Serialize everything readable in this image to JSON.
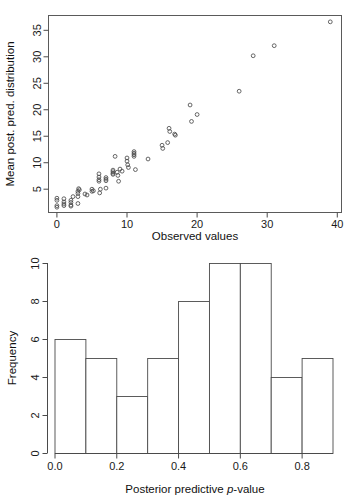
{
  "figure": {
    "panels": [
      "scatter",
      "histogram"
    ]
  },
  "chart_data": [
    {
      "type": "scatter",
      "title": "",
      "xlabel": "Observed values",
      "ylabel": "Mean post. pred. distribution",
      "xlim": [
        -1.2,
        40.6
      ],
      "ylim": [
        0.6,
        37.8
      ],
      "xticks": [
        0,
        10,
        20,
        30,
        40
      ],
      "xticklabels": [
        "0",
        "10",
        "20",
        "30",
        "40"
      ],
      "yticks": [
        5,
        10,
        15,
        20,
        25,
        30,
        35
      ],
      "yticklabels": [
        "5",
        "10",
        "15",
        "20",
        "25",
        "30",
        "35"
      ],
      "grid": false,
      "legend": null,
      "marker": "open-circle",
      "points": [
        [
          0.0,
          3.3
        ],
        [
          0.0,
          2.9
        ],
        [
          0.0,
          1.9
        ],
        [
          0.0,
          1.6
        ],
        [
          1.0,
          3.2
        ],
        [
          1.0,
          2.6
        ],
        [
          1.0,
          2.2
        ],
        [
          1.0,
          1.9
        ],
        [
          2.0,
          2.9
        ],
        [
          2.0,
          2.5
        ],
        [
          2.0,
          2.0
        ],
        [
          2.0,
          1.8
        ],
        [
          2.3,
          3.6
        ],
        [
          3.0,
          4.6
        ],
        [
          3.0,
          4.2
        ],
        [
          3.0,
          3.6
        ],
        [
          3.1,
          5.1
        ],
        [
          3.2,
          4.9
        ],
        [
          3.0,
          2.3
        ],
        [
          4.0,
          4.1
        ],
        [
          4.3,
          3.9
        ],
        [
          5.0,
          5.0
        ],
        [
          5.2,
          4.7
        ],
        [
          5.0,
          4.6
        ],
        [
          6.0,
          7.9
        ],
        [
          6.0,
          7.3
        ],
        [
          6.0,
          6.8
        ],
        [
          6.0,
          6.5
        ],
        [
          6.1,
          4.3
        ],
        [
          6.2,
          5.0
        ],
        [
          7.0,
          7.2
        ],
        [
          7.0,
          6.9
        ],
        [
          7.0,
          6.6
        ],
        [
          7.0,
          5.2
        ],
        [
          8.0,
          8.6
        ],
        [
          8.0,
          8.3
        ],
        [
          8.0,
          8.0
        ],
        [
          8.0,
          7.8
        ],
        [
          8.3,
          11.2
        ],
        [
          8.6,
          8.2
        ],
        [
          8.7,
          7.6
        ],
        [
          8.8,
          6.5
        ],
        [
          9.0,
          8.8
        ],
        [
          9.3,
          8.4
        ],
        [
          10.0,
          10.9
        ],
        [
          10.0,
          10.3
        ],
        [
          10.1,
          9.6
        ],
        [
          10.2,
          9.1
        ],
        [
          11.0,
          12.1
        ],
        [
          11.0,
          11.8
        ],
        [
          11.0,
          11.5
        ],
        [
          11.0,
          11.2
        ],
        [
          11.2,
          8.7
        ],
        [
          13.0,
          10.7
        ],
        [
          15.0,
          13.3
        ],
        [
          15.1,
          12.7
        ],
        [
          15.8,
          13.8
        ],
        [
          16.0,
          16.5
        ],
        [
          16.1,
          15.9
        ],
        [
          16.8,
          15.4
        ],
        [
          16.9,
          15.2
        ],
        [
          19.0,
          20.9
        ],
        [
          19.2,
          17.8
        ],
        [
          20.0,
          19.1
        ],
        [
          26.0,
          23.5
        ],
        [
          28.0,
          30.2
        ],
        [
          31.0,
          32.1
        ],
        [
          39.0,
          36.6
        ]
      ]
    },
    {
      "type": "bar",
      "subtype": "histogram",
      "title": "",
      "xlabel": "Posterior predictive p-value",
      "xlabel_parts": [
        "Posterior predictive ",
        "p",
        "-value"
      ],
      "ylabel": "Frequency",
      "xlim": [
        -0.03,
        0.925
      ],
      "ylim": [
        0,
        10
      ],
      "xticks": [
        0.0,
        0.2,
        0.4,
        0.6,
        0.8
      ],
      "xticklabels": [
        "0.0",
        "0.2",
        "0.4",
        "0.6",
        "0.8"
      ],
      "yticks": [
        0,
        2,
        4,
        6,
        8,
        10
      ],
      "yticklabels": [
        "0",
        "2",
        "4",
        "6",
        "8",
        "10"
      ],
      "grid": false,
      "legend": null,
      "bin_edges": [
        0.0,
        0.1,
        0.2,
        0.3,
        0.4,
        0.5,
        0.6,
        0.7,
        0.8,
        0.9
      ],
      "bin_labels": [
        "0.0-0.1",
        "0.1-0.2",
        "0.2-0.3",
        "0.3-0.4",
        "0.4-0.5",
        "0.5-0.6",
        "0.6-0.7",
        "0.7-0.8",
        "0.8-0.9"
      ],
      "values": [
        6,
        5,
        3,
        5,
        8,
        10,
        10,
        4,
        5
      ],
      "bar_fill": "#ffffff",
      "bar_stroke": "#4a4a4a"
    }
  ]
}
